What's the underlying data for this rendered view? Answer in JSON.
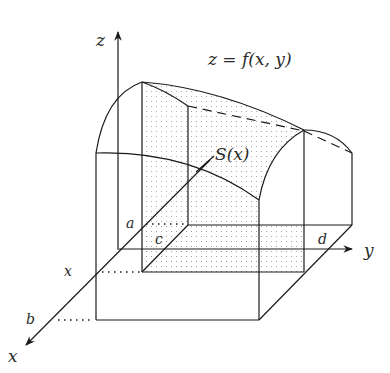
{
  "figure": {
    "type": "3d-solid-cross-section",
    "colors": {
      "line": "#1a1a1a",
      "shade_dot": "#9a9a9a",
      "background": "#ffffff"
    }
  },
  "labels": {
    "z_axis": "z",
    "y_axis": "y",
    "x_axis": "x",
    "surface": "z = f(x, y)",
    "cross_section": "S(x)",
    "a": "a",
    "b": "b",
    "c": "c",
    "d": "d",
    "x_tick": "x"
  }
}
